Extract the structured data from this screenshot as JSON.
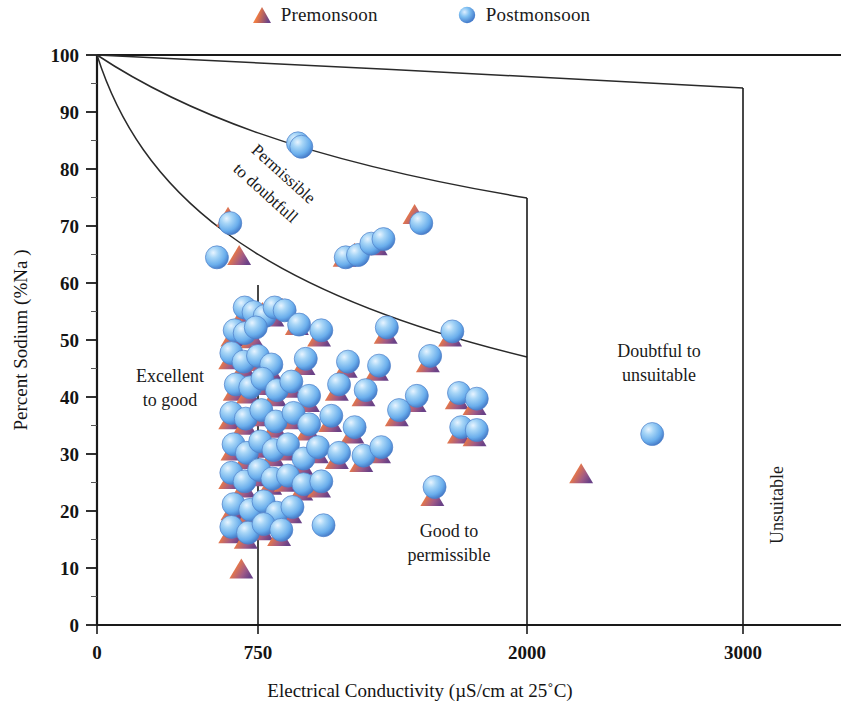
{
  "legend": {
    "items": [
      {
        "label": "Premonsoon",
        "marker": "triangle-marker",
        "color_light": "#f0814a",
        "color_dark": "#7b4a8c"
      },
      {
        "label": "Postmonsoon",
        "marker": "circle-marker",
        "color_light": "#a9d4f5",
        "color_dark": "#2f66c8"
      }
    ]
  },
  "chart_data": {
    "type": "scatter",
    "title": "",
    "xlabel": "Electrical Conductivity (µS/cm at 25˚C)",
    "ylabel": "Percent Sodium (%Na )",
    "xlim": [
      0,
      3350
    ],
    "ylim": [
      0,
      100
    ],
    "xticks": [
      0,
      750,
      2000,
      3000
    ],
    "xtick_labels": [
      "0",
      "750",
      "2000",
      "3000"
    ],
    "yticks": [
      0,
      10,
      20,
      30,
      40,
      50,
      60,
      70,
      80,
      90,
      100
    ],
    "ytick_labels": [
      "0",
      "10",
      "20",
      "30",
      "40",
      "50",
      "60",
      "70",
      "80",
      "90",
      "100"
    ],
    "grid": false,
    "legend_position": "top-center",
    "region_labels": [
      {
        "text": "Excellent to good",
        "lines": [
          "Excellent",
          "to good"
        ],
        "x": 300,
        "y": 39
      },
      {
        "text": "Good to permissible",
        "lines": [
          "Good to",
          "permissible"
        ],
        "x": 1480,
        "y": 16
      },
      {
        "text": "Doubtful to unsuitable",
        "lines": [
          "Doubtful to",
          "unsuitable"
        ],
        "x": 2560,
        "y": 44
      },
      {
        "text": "Permissible to doubtfull",
        "lines": [
          "Permissible",
          "to doubtfull"
        ],
        "rotated": true
      },
      {
        "text": "Unsuitable",
        "rotated": true,
        "vertical": true
      }
    ],
    "boundary_curves": [
      {
        "name": "excellent-permissible-boundary",
        "from": [
          0,
          100
        ],
        "to": [
          2000,
          47
        ]
      },
      {
        "name": "permissible-doubtful-boundary",
        "from": [
          0,
          100
        ],
        "to": [
          2000,
          75
        ]
      },
      {
        "name": "doubtful-unsuitable-boundary",
        "from": [
          0,
          100
        ],
        "to": [
          3000,
          95
        ]
      }
    ],
    "divider_lines": [
      {
        "name": "divider-750",
        "x": 750,
        "y_from": 0,
        "y_to": 65
      },
      {
        "name": "divider-2000",
        "x": 2000,
        "y_from": 0,
        "y_to": 75
      },
      {
        "name": "divider-3000",
        "x": 3000,
        "y_from": 0,
        "y_to": 95
      }
    ],
    "series": [
      {
        "name": "Premonsoon",
        "marker": "triangle",
        "points": [
          [
            590,
            71.5
          ],
          [
            1430,
            72
          ],
          [
            640,
            64.8
          ],
          [
            1115,
            64.5
          ],
          [
            1160,
            65.2
          ],
          [
            1255,
            66.5
          ],
          [
            660,
            54.5
          ],
          [
            700,
            53.5
          ],
          [
            745,
            54.8
          ],
          [
            790,
            54
          ],
          [
            835,
            55.5
          ],
          [
            610,
            50.5
          ],
          [
            650,
            51.8
          ],
          [
            700,
            50.2
          ],
          [
            900,
            52.5
          ],
          [
            1000,
            50.5
          ],
          [
            1300,
            51
          ],
          [
            1590,
            50.5
          ],
          [
            600,
            46.5
          ],
          [
            660,
            45
          ],
          [
            720,
            46.2
          ],
          [
            780,
            44.5
          ],
          [
            930,
            45.5
          ],
          [
            1120,
            45
          ],
          [
            1260,
            44.5
          ],
          [
            1490,
            46
          ],
          [
            620,
            41
          ],
          [
            680,
            40.5
          ],
          [
            740,
            42
          ],
          [
            800,
            40
          ],
          [
            870,
            41.5
          ],
          [
            950,
            39
          ],
          [
            1080,
            41
          ],
          [
            1200,
            40
          ],
          [
            1430,
            39
          ],
          [
            1620,
            39.5
          ],
          [
            1700,
            38.5
          ],
          [
            600,
            36
          ],
          [
            665,
            35
          ],
          [
            735,
            36.5
          ],
          [
            800,
            34.5
          ],
          [
            880,
            36
          ],
          [
            950,
            34
          ],
          [
            1050,
            35.5
          ],
          [
            1150,
            33.5
          ],
          [
            1350,
            36.5
          ],
          [
            1630,
            33.5
          ],
          [
            1700,
            33
          ],
          [
            610,
            30.5
          ],
          [
            670,
            29
          ],
          [
            730,
            31
          ],
          [
            790,
            29.5
          ],
          [
            850,
            30.5
          ],
          [
            920,
            28
          ],
          [
            990,
            30
          ],
          [
            1080,
            29
          ],
          [
            1190,
            28.5
          ],
          [
            1270,
            30
          ],
          [
            2180,
            26.5
          ],
          [
            600,
            25.5
          ],
          [
            660,
            24
          ],
          [
            720,
            26
          ],
          [
            780,
            24.5
          ],
          [
            850,
            25
          ],
          [
            920,
            23.5
          ],
          [
            1000,
            24
          ],
          [
            1510,
            22.5
          ],
          [
            610,
            20
          ],
          [
            680,
            19
          ],
          [
            740,
            20.5
          ],
          [
            800,
            18.5
          ],
          [
            870,
            19.5
          ],
          [
            600,
            16
          ],
          [
            670,
            15
          ],
          [
            740,
            16.5
          ],
          [
            820,
            15.5
          ],
          [
            650,
            9.8
          ]
        ]
      },
      {
        "name": "Postmonsoon",
        "marker": "circle",
        "points": [
          [
            905,
            83.8
          ],
          [
            920,
            83.2
          ],
          [
            600,
            69.8
          ],
          [
            1460,
            69.8
          ],
          [
            1120,
            63.8
          ],
          [
            1175,
            64.2
          ],
          [
            1235,
            66.2
          ],
          [
            1290,
            67
          ],
          [
            540,
            63.8
          ],
          [
            665,
            55
          ],
          [
            705,
            54.2
          ],
          [
            755,
            53.5
          ],
          [
            800,
            55
          ],
          [
            845,
            54.5
          ],
          [
            620,
            51
          ],
          [
            665,
            50.5
          ],
          [
            715,
            51.5
          ],
          [
            910,
            52
          ],
          [
            1010,
            51
          ],
          [
            1305,
            51.5
          ],
          [
            1600,
            50.8
          ],
          [
            605,
            47
          ],
          [
            660,
            45.5
          ],
          [
            725,
            46.5
          ],
          [
            785,
            45
          ],
          [
            940,
            46
          ],
          [
            1130,
            45.5
          ],
          [
            1270,
            44.8
          ],
          [
            1500,
            46.5
          ],
          [
            625,
            41.5
          ],
          [
            690,
            41
          ],
          [
            745,
            42.5
          ],
          [
            810,
            40.5
          ],
          [
            875,
            42
          ],
          [
            955,
            39.5
          ],
          [
            1090,
            41.5
          ],
          [
            1210,
            40.5
          ],
          [
            1440,
            39.5
          ],
          [
            1630,
            40
          ],
          [
            1710,
            39
          ],
          [
            605,
            36.5
          ],
          [
            670,
            35.5
          ],
          [
            740,
            37
          ],
          [
            805,
            35
          ],
          [
            885,
            36.5
          ],
          [
            955,
            34.5
          ],
          [
            1055,
            36
          ],
          [
            1160,
            34
          ],
          [
            1360,
            37
          ],
          [
            1640,
            34
          ],
          [
            1710,
            33.5
          ],
          [
            2500,
            32.8
          ],
          [
            615,
            31
          ],
          [
            675,
            29.5
          ],
          [
            735,
            31.5
          ],
          [
            795,
            30
          ],
          [
            860,
            31
          ],
          [
            930,
            28.5
          ],
          [
            995,
            30.5
          ],
          [
            1090,
            29.5
          ],
          [
            1200,
            29
          ],
          [
            1280,
            30.5
          ],
          [
            605,
            26
          ],
          [
            665,
            24.5
          ],
          [
            730,
            26.5
          ],
          [
            790,
            25
          ],
          [
            860,
            25.5
          ],
          [
            930,
            24
          ],
          [
            1010,
            24.5
          ],
          [
            1520,
            23.5
          ],
          [
            615,
            20.5
          ],
          [
            690,
            19.5
          ],
          [
            750,
            21
          ],
          [
            810,
            19
          ],
          [
            880,
            20
          ],
          [
            605,
            16.5
          ],
          [
            680,
            15.5
          ],
          [
            750,
            17
          ],
          [
            830,
            16
          ],
          [
            1020,
            16.8
          ]
        ]
      }
    ]
  }
}
